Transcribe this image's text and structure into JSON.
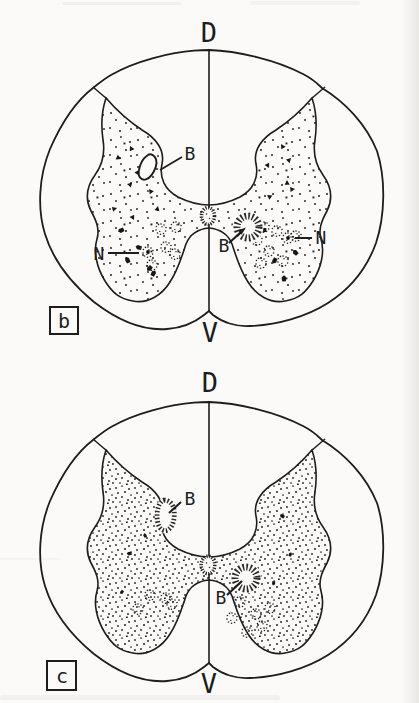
{
  "figure": {
    "ink_color": "#1d1d1d",
    "paper_color": "#fbfaf8",
    "panels": [
      {
        "panel_letter": "b",
        "dorsal_label": "D",
        "ventral_label": "V",
        "dorsal_structure_label": "B",
        "central_structure_label": "B",
        "left_nucleus_label": "N",
        "right_nucleus_label": "N"
      },
      {
        "panel_letter": "c",
        "dorsal_label": "D",
        "ventral_label": "V",
        "dorsal_structure_label": "B",
        "central_structure_label": "B"
      }
    ]
  }
}
